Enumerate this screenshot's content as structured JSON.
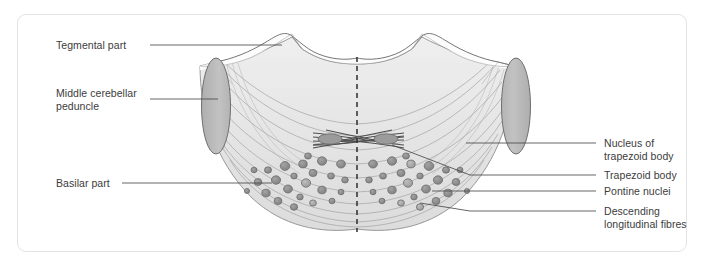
{
  "figure": {
    "background_color": "#ffffff",
    "frame_border_color": "#e3e3e3",
    "midline_style": "dashed"
  },
  "labels": {
    "left": [
      {
        "id": "tegmental-part",
        "text": "Tegmental part"
      },
      {
        "id": "middle-cerebellar-peduncle",
        "text": "Middle cerebellar\npeduncle"
      },
      {
        "id": "basilar-part",
        "text": "Basilar part"
      }
    ],
    "right": [
      {
        "id": "nucleus-of-trapezoid-body",
        "text": "Nucleus of\ntrapezoid body"
      },
      {
        "id": "trapezoid-body",
        "text": "Trapezoid body"
      },
      {
        "id": "pontine-nuclei",
        "text": "Pontine nuclei"
      },
      {
        "id": "descending-longitudinal-fibres",
        "text": "Descending\nlongitudinal fibres"
      }
    ]
  },
  "colors": {
    "outline": "#6e6e6e",
    "tegmentum_fill": "#fbfbfb",
    "basilar_fill": "#e7e7e7",
    "peduncle_fill": "#b9b9b9",
    "peduncle_stroke": "#7c7c7c",
    "nuclei_fill": "#8d8d8d",
    "nuclei_fill_light": "#a9a9a9",
    "nuclei_stroke": "#6a6a6a",
    "fibre_stroke": "#9a9a9a",
    "trapezoid_nucleus_fill": "#9e9e9e",
    "leader_line": "#4a4a4a",
    "text": "#3c3c3c"
  },
  "structures": {
    "midline": {
      "x": 357,
      "y_top": 57,
      "y_bottom": 232
    },
    "peduncle_left": {
      "cx": 216,
      "cy": 106,
      "rx": 14,
      "ry": 48
    },
    "peduncle_right": {
      "cx": 516,
      "cy": 106,
      "rx": 14,
      "ry": 48
    },
    "trapezoid_nucleus_left": {
      "cx": 331,
      "cy": 139,
      "rx": 12,
      "ry": 5
    },
    "trapezoid_nucleus_right": {
      "cx": 385,
      "cy": 139,
      "rx": 12,
      "ry": 5
    },
    "pontine_nuclei_count": 48
  },
  "leaders": {
    "tegmental_part": {
      "x1": 150,
      "y1": 45,
      "x2": 282,
      "y2": 45
    },
    "middle_cerebellar_peduncle": {
      "x1": 150,
      "y1": 99,
      "x2": 218,
      "y2": 99
    },
    "basilar_part": {
      "x1": 122,
      "y1": 183,
      "x2": 270,
      "y2": 183
    },
    "nucleus_of_trapezoid_body": {
      "x1": 596,
      "y1": 143,
      "x2": 466,
      "y2": 143
    },
    "trapezoid_body": {
      "x1": 596,
      "y1": 175,
      "x2": 386,
      "y2": 148
    },
    "pontine_nuclei": {
      "x1": 596,
      "y1": 191,
      "x2": 430,
      "y2": 191
    },
    "descending_longitudinal_fibres": {
      "x1": 596,
      "y1": 211,
      "x2": 422,
      "y2": 206
    }
  }
}
